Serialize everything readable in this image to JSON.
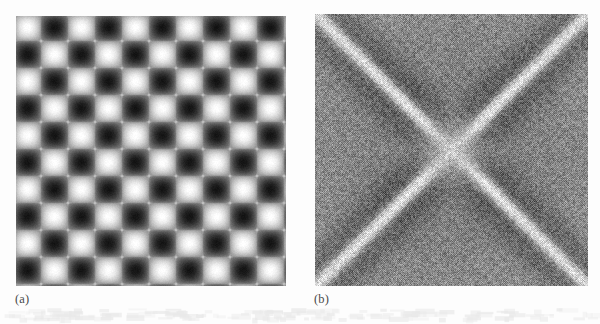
{
  "figure": {
    "background_color": "#fdfdfd",
    "width": 600,
    "height": 324,
    "label_color": "#4a4a4a",
    "panels": [
      {
        "id": "a",
        "label": "(a)",
        "kind": "grayscale-image",
        "description": "Spatial-domain image: separable cosine pattern forming a checkerboard of diamond cells with alternating bright and dark centers",
        "x": 16,
        "y": 16,
        "width": 270,
        "height": 270
      },
      {
        "id": "b",
        "label": "(b)",
        "kind": "grayscale-image",
        "description": "Fourier magnitude spectrum: bright diagonal X-shaped cross of energy over a dithered mid-gray noise field",
        "x": 315,
        "y": 14,
        "width": 273,
        "height": 272
      }
    ]
  },
  "chart_data": [
    {
      "type": "heatmap",
      "id": "panel-a",
      "title": "(a)",
      "xlabel": "",
      "ylabel": "",
      "grid": false,
      "legend": "none",
      "colormap": "grayscale",
      "value_range": [
        0,
        255
      ],
      "pixel_size": [
        270,
        270
      ],
      "pattern": "diamond-checkerboard",
      "formula": "I(x,y) = 128 + 127 * cos(2*pi*x/T) * cos(2*pi*y/T)",
      "period_px": 54,
      "half_period_px": 27,
      "cells_across": 5,
      "cells_down": 5,
      "bright_center_value": 255,
      "dark_center_value": 20,
      "edge_mid_value": 210,
      "crease_sharpness": 0.62,
      "note": "Bright diamond centers are arranged on a square lattice of period 54 px; dark diamond centers are offset by half a period in both x and y."
    },
    {
      "type": "heatmap",
      "id": "panel-b",
      "title": "(b)",
      "xlabel": "",
      "ylabel": "",
      "grid": false,
      "legend": "none",
      "colormap": "grayscale",
      "value_range": [
        0,
        255
      ],
      "pixel_size": [
        273,
        272
      ],
      "pattern": "diagonal-cross-spectrum",
      "structure": "two bright diagonal ridges at +45 and -45 degrees crossing at the image centre, each flanked by a darker lobe",
      "ridge_angles_deg": [
        45,
        135
      ],
      "ridge_half_width_px": 7,
      "ridge_peak_value": 236,
      "background_mean_value": 122,
      "corner_mean_value": 150,
      "centre_glow_radius_px": 34,
      "centre_glow_value": 196,
      "noise_amplitude": 52,
      "dither_contrast": 0.55,
      "note": "Log-magnitude DFT rendered with an ordered dither; visible high-frequency checker texture throughout."
    }
  ]
}
